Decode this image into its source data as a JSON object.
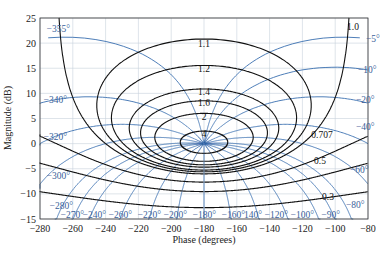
{
  "chart_data": {
    "type": "line",
    "xlabel": "Phase (degrees)",
    "ylabel": "Magnitude (dB)",
    "xlim": [
      -280,
      -80
    ],
    "ylim": [
      -15,
      25
    ],
    "xticks": [
      -280,
      -260,
      -240,
      -220,
      -200,
      -180,
      -160,
      -140,
      -120,
      -100,
      -80
    ],
    "yticks": [
      -15,
      -10,
      -5,
      0,
      5,
      10,
      15,
      20,
      25
    ],
    "grid": true,
    "colors": {
      "m_contours": "#111111",
      "n_contours": "#3a6fb0",
      "grid": "#c8d2dc"
    },
    "m_contours": {
      "description": "Constant closed-loop magnitude M (linear)",
      "values": [
        0.3,
        0.5,
        0.707,
        1.0,
        1.1,
        1.2,
        1.4,
        1.6,
        2,
        4
      ],
      "labels": [
        "0.3",
        "0.5",
        "0.707",
        "1.0",
        "1.1",
        "1.2",
        "1.4",
        "1.6",
        "2",
        "4"
      ]
    },
    "n_contours": {
      "description": "Constant closed-loop phase (degrees)",
      "values": [
        -5,
        -10,
        -20,
        -40,
        -60,
        -80,
        -90,
        -100,
        -120,
        -140,
        -160,
        -180,
        -200,
        -220,
        -240,
        -260,
        -270,
        -280,
        -300,
        -320,
        -340,
        -355
      ],
      "labels": [
        "-5°",
        "-10°",
        "-20°",
        "-40°",
        "-60°",
        "-80°",
        "-90°",
        "-100°",
        "-120°",
        "140°",
        "-160°",
        "-180°",
        "-200°",
        "-220°",
        "-240°",
        "-260°",
        "-270°",
        "-280°",
        "-300°",
        "-320°",
        "-340°",
        "-355°"
      ]
    }
  }
}
